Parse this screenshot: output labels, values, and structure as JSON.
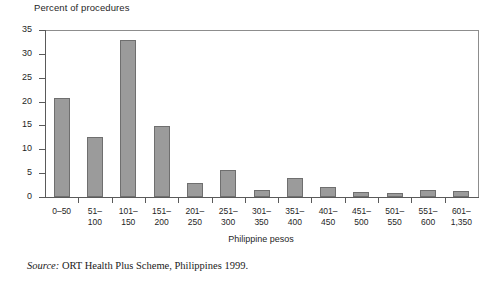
{
  "chart_data": {
    "type": "bar",
    "title": "Percent of procedures",
    "xlabel": "Philippine pesos",
    "ylabel": "",
    "categories": [
      "0–50",
      "51–\n100",
      "101–\n150",
      "151–\n200",
      "201–\n250",
      "251–\n300",
      "301–\n350",
      "351–\n400",
      "401–\n450",
      "451–\n500",
      "501–\n550",
      "551–\n600",
      "601–\n1,350"
    ],
    "values": [
      20.8,
      12.5,
      32.8,
      14.9,
      2.9,
      5.6,
      1.5,
      4.0,
      2.1,
      1.0,
      0.8,
      1.5,
      1.2
    ],
    "ylim": [
      0,
      35
    ],
    "yticks": [
      0,
      5,
      10,
      15,
      20,
      25,
      30,
      35
    ],
    "ytick_labels": [
      "0",
      "5",
      "10",
      "15",
      "20",
      "25",
      "30",
      "35"
    ],
    "grid": false,
    "legend": null,
    "bar_color": "#9b9b9b",
    "bar_border_color": "#6f6f6f",
    "axis_color": "#5a5a5a"
  },
  "source": {
    "label": "Source:",
    "text": " ORT Health Plus Scheme, Philippines 1999."
  }
}
